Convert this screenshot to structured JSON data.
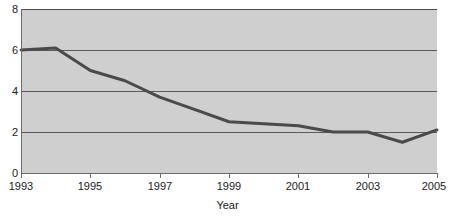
{
  "chart_data": {
    "type": "line",
    "title": "",
    "xlabel": "Year",
    "ylabel": "",
    "x": [
      1993,
      1994,
      1995,
      1996,
      1997,
      1998,
      1999,
      2000,
      2001,
      2002,
      2003,
      2004,
      2005
    ],
    "values": [
      6.0,
      6.1,
      5.0,
      4.5,
      3.7,
      3.1,
      2.5,
      2.4,
      2.3,
      2.0,
      2.0,
      1.5,
      2.1
    ],
    "series": [
      {
        "name": "series-1",
        "values": [
          6.0,
          6.1,
          5.0,
          4.5,
          3.7,
          3.1,
          2.5,
          2.4,
          2.3,
          2.0,
          2.0,
          1.5,
          2.1
        ]
      }
    ],
    "xlim": [
      1993,
      2005
    ],
    "ylim": [
      0,
      8
    ],
    "y_ticks": [
      0,
      2,
      4,
      6,
      8
    ],
    "y_tick_labels": [
      "0",
      "2",
      "4",
      "6",
      "8"
    ],
    "x_ticks": [
      1993,
      1995,
      1997,
      1999,
      2001,
      2003,
      2005
    ],
    "x_tick_labels": [
      "1993",
      "1995",
      "1997",
      "1999",
      "2001",
      "2003",
      "2005"
    ],
    "grid": true,
    "grid_orientation": "horizontal",
    "legend": null,
    "legend_position": "none",
    "plot_background_color": "#cfcfcf",
    "line_color": "#4a4a4a",
    "line_width": 3,
    "markers": false,
    "annotations": []
  },
  "figure": {
    "background_color": "#ffffff",
    "clipped_title": ""
  }
}
